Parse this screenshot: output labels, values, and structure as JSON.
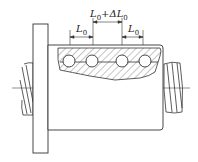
{
  "diagram": {
    "colors": {
      "line": "#333333",
      "background": "#ffffff",
      "hatch": "#555555"
    },
    "labels": {
      "left_pitch": {
        "main": "L",
        "sub": "0",
        "suffix": ""
      },
      "center_pitch": {
        "main": "L",
        "sub": "0",
        "suffix": "+ΔL",
        "sub2": "0"
      },
      "right_pitch": {
        "main": "L",
        "sub": "0",
        "suffix": ""
      }
    },
    "components": [
      "flange",
      "nut-body",
      "hatched-section",
      "balls",
      "screw-shaft-left",
      "screw-shaft-right",
      "centerline"
    ],
    "ball_count": 4
  }
}
